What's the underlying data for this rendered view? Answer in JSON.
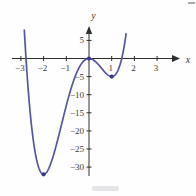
{
  "figure": {
    "background": "#fefefe",
    "curve_color": "#5456a2",
    "point_color": "#39398c",
    "axis_color": "#2e2e2e",
    "tick_label_color": "#3a3a3a"
  },
  "chart_data": {
    "type": "line",
    "title": "",
    "xlabel": "x",
    "ylabel": "y",
    "xlim": [
      -3.4,
      3.9
    ],
    "ylim": [
      -34,
      8
    ],
    "grid": false,
    "legend": null,
    "x_ticks": [
      -3,
      -2,
      -1,
      1,
      2,
      3
    ],
    "y_ticks": [
      5,
      -5,
      -10,
      -15,
      -20,
      -25,
      -30
    ],
    "curve": {
      "expression": "3x^4 + 4x^3 - 12x^2",
      "coefficients": {
        "x4": 3,
        "x3": 4,
        "x2": -12,
        "x1": 0,
        "x0": 0
      },
      "domain": [
        -2.85,
        1.645
      ]
    },
    "marked_points": [
      {
        "x": -2,
        "y": -32,
        "label": "local-minimum"
      },
      {
        "x": 0,
        "y": 0,
        "label": "local-maximum"
      },
      {
        "x": 1,
        "y": -5,
        "label": "local-minimum"
      }
    ],
    "x_intercepts": [
      -2.77,
      0,
      1.44
    ],
    "minus_sign": "−"
  }
}
